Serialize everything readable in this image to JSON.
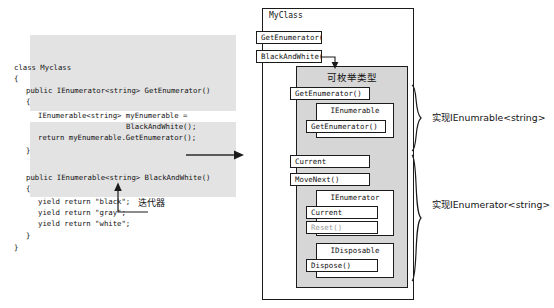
{
  "code_panel": {
    "lines": [
      {
        "x": 0,
        "y": 0,
        "text": "class Myclass"
      },
      {
        "x": 0,
        "y": 11,
        "text": "{"
      },
      {
        "x": 12,
        "y": 23,
        "text": "public IEnumerator<string> GetEnumerator()"
      },
      {
        "x": 12,
        "y": 34,
        "text": "{"
      },
      {
        "x": 24,
        "y": 48,
        "text": "IEnumerable<string> myEnumerable ="
      },
      {
        "x": 112,
        "y": 59,
        "text": "BlackAndWhite();"
      },
      {
        "x": 24,
        "y": 70,
        "text": "return myEnumerable.GetEnumerator();"
      },
      {
        "x": 12,
        "y": 83,
        "text": "}"
      },
      {
        "x": 12,
        "y": 110,
        "text": "public IEnumerable<string> BlackAndWhite()"
      },
      {
        "x": 12,
        "y": 121,
        "text": "{"
      },
      {
        "x": 24,
        "y": 134,
        "text": "yield return \"black\";"
      },
      {
        "x": 24,
        "y": 145,
        "text": "yield return \"gray\";"
      },
      {
        "x": 24,
        "y": 156,
        "text": "yield return \"white\";"
      },
      {
        "x": 12,
        "y": 168,
        "text": "}"
      },
      {
        "x": 0,
        "y": 180,
        "text": "}"
      }
    ]
  },
  "iterator_callout": {
    "label": "迭代器"
  },
  "diagram": {
    "class_title": "MyClass",
    "class_methods": [
      {
        "label": "GetEnumerator()",
        "x": 256,
        "y": 31,
        "w": 66,
        "h": 13
      },
      {
        "label": "BlackAndWhite()",
        "x": 256,
        "y": 50,
        "w": 66,
        "h": 13
      }
    ],
    "enumerable_panel": {
      "title": "可枚举类型",
      "members": [
        {
          "label": "GetEnumerator()",
          "x": 290,
          "y": 87,
          "w": 80,
          "h": 13
        },
        {
          "label": "Current",
          "x": 290,
          "y": 155,
          "w": 80,
          "h": 13
        },
        {
          "label": "MoveNext()",
          "x": 290,
          "y": 173,
          "w": 80,
          "h": 13
        }
      ],
      "interfaces": [
        {
          "name": "IEnumerable",
          "x": 316,
          "y": 103,
          "w": 78,
          "h": 35,
          "members": [
            {
              "label": "GetEnumerator()",
              "x": 306,
              "y": 120,
              "w": 80,
              "h": 13,
              "dim": false
            }
          ]
        },
        {
          "name": "IEnumerator",
          "x": 316,
          "y": 190,
          "w": 78,
          "h": 46,
          "members": [
            {
              "label": "Current",
              "x": 306,
              "y": 206,
              "w": 72,
              "h": 13,
              "dim": false
            },
            {
              "label": "Reset()",
              "x": 306,
              "y": 221,
              "w": 72,
              "h": 13,
              "dim": true
            }
          ]
        },
        {
          "name": "IDisposable",
          "x": 316,
          "y": 243,
          "w": 78,
          "h": 35,
          "members": [
            {
              "label": "Dispose()",
              "x": 306,
              "y": 259,
              "w": 72,
              "h": 13,
              "dim": false
            }
          ]
        }
      ]
    },
    "annotations": [
      {
        "label": "实现IEnumrable<string>",
        "x": 432,
        "y": 110
      },
      {
        "label": "实现IEnumerator<string>",
        "x": 432,
        "y": 197
      }
    ]
  }
}
